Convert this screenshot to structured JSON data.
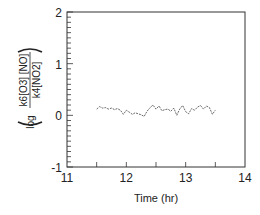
{
  "chart_data": {
    "type": "line",
    "title": "",
    "xlabel": "Time (hr)",
    "ylabel": "log ( k6[O3][NO] / k4[NO2] )",
    "xlim": [
      11,
      14
    ],
    "ylim": [
      -1,
      2
    ],
    "xticks": [
      "11",
      "12",
      "13",
      "14"
    ],
    "yticks": [
      "-1",
      "0",
      "1",
      "2"
    ],
    "grid": false,
    "legend": null,
    "x": [
      11.5,
      11.55,
      11.6,
      11.65,
      11.7,
      11.75,
      11.8,
      11.85,
      11.9,
      11.95,
      12.0,
      12.05,
      12.1,
      12.15,
      12.2,
      12.25,
      12.3,
      12.35,
      12.4,
      12.45,
      12.5,
      12.55,
      12.6,
      12.65,
      12.7,
      12.75,
      12.8,
      12.85,
      12.9,
      12.95,
      13.0,
      13.05,
      13.1,
      13.15,
      13.2,
      13.25,
      13.3,
      13.35,
      13.4,
      13.45,
      13.5
    ],
    "values": [
      0.12,
      0.17,
      0.14,
      0.15,
      0.12,
      0.14,
      0.11,
      0.13,
      0.1,
      0.02,
      0.1,
      0.06,
      0.02,
      0.05,
      0.03,
      0.01,
      -0.02,
      0.08,
      0.15,
      0.2,
      0.12,
      0.18,
      0.09,
      0.11,
      0.12,
      0.08,
      0.14,
      0.0,
      0.12,
      0.19,
      0.07,
      0.03,
      0.13,
      0.1,
      0.16,
      0.19,
      0.12,
      0.18,
      0.15,
      0.02,
      0.1
    ]
  },
  "axes": {
    "x_title": "Time (hr)",
    "y_title_log": "log",
    "y_title_num": "k6[O3] [NO]",
    "y_title_den": "k4[NO2]",
    "x_tick_labels": [
      "11",
      "12",
      "13",
      "14"
    ],
    "y_tick_labels": [
      "2",
      "1",
      "0",
      "-1"
    ]
  }
}
